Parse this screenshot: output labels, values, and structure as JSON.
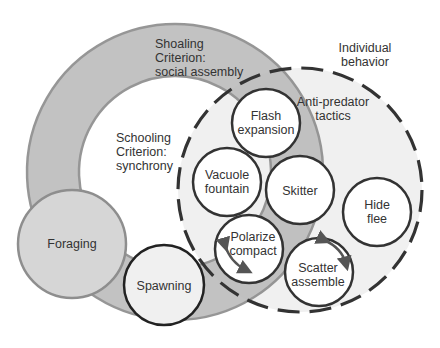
{
  "diagram": {
    "type": "nested-venn",
    "colors": {
      "shoaling_ring": "#bdbdbd",
      "ring_edge": "#8e8e8e",
      "individual_fill": "#f0f0f0",
      "foraging_fill": "#d6d6d6",
      "circle_fill": "#ffffff",
      "circle_stroke": "#333333",
      "dash_stroke": "#333333",
      "text": "#333333"
    },
    "regions": {
      "shoaling": {
        "line1": "Shoaling",
        "line2": "Criterion:",
        "line3": "social assembly"
      },
      "schooling": {
        "line1": "Schooling",
        "line2": "Criterion:",
        "line3": "synchrony"
      },
      "individual": {
        "line1": "Individual",
        "line2": "behavior"
      },
      "antipredator": {
        "line1": "Anti-predator",
        "line2": "tactics"
      }
    },
    "nodes": [
      {
        "id": "foraging",
        "line1": "Foraging"
      },
      {
        "id": "spawning",
        "line1": "Spawning"
      },
      {
        "id": "flash",
        "line1": "Flash",
        "line2": "expansion"
      },
      {
        "id": "vacuole",
        "line1": "Vacuole",
        "line2": "fountain"
      },
      {
        "id": "skitter",
        "line1": "Skitter"
      },
      {
        "id": "polarize",
        "line1": "Polarize",
        "line2": "compact"
      },
      {
        "id": "scatter",
        "line1": "Scatter",
        "line2": "assemble"
      },
      {
        "id": "hide",
        "line1": "Hide",
        "line2": "flee"
      }
    ]
  }
}
